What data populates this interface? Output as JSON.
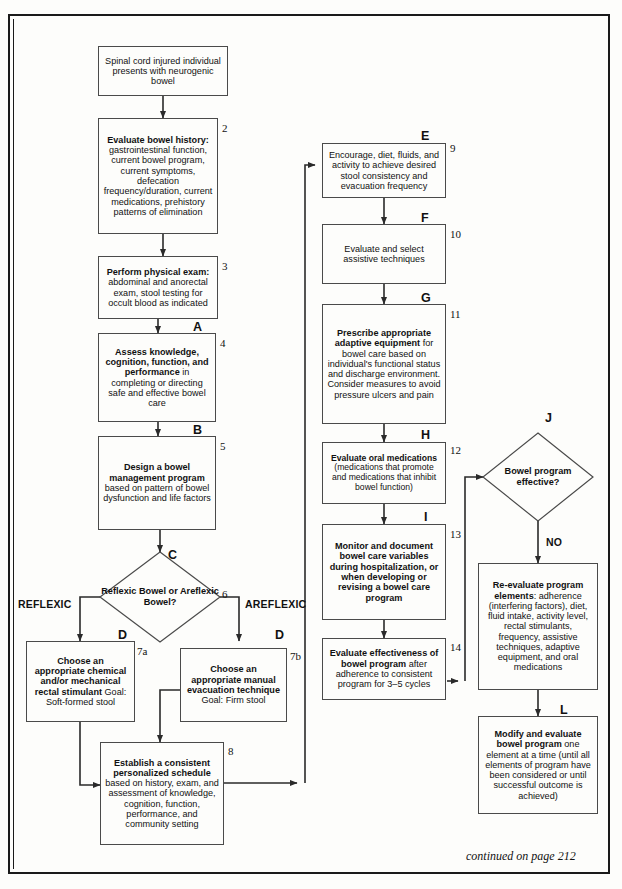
{
  "document": {
    "title": "Neurogenic Bowel Management Algorithm",
    "footer_note": "continued on page 212"
  },
  "branch_labels": {
    "left": "REFLEXIC",
    "right": "AREFLEXIC",
    "no": "NO"
  },
  "nodes": [
    {
      "id": "n1",
      "number": "",
      "letter": "",
      "shape": "box",
      "text_html": "Spinal cord injured individual presents with neurogenic bowel",
      "bold_prefix": ""
    },
    {
      "id": "n2",
      "number": "2",
      "letter": "",
      "shape": "box",
      "bold_prefix": "Evaluate bowel history:",
      "text_html": " gastrointestinal function, current bowel program, current symptoms, defecation frequency/duration, current medications, prehistory patterns of elimination"
    },
    {
      "id": "n3",
      "number": "3",
      "letter": "",
      "shape": "box",
      "bold_prefix": "Perform physical exam:",
      "text_html": " abdominal and anorectal exam, stool testing for occult blood as indicated"
    },
    {
      "id": "n4",
      "number": "4",
      "letter": "A",
      "shape": "box",
      "bold_prefix": "Assess knowledge, cognition, function, and performance",
      "text_html": " in completing or directing safe and effective bowel care"
    },
    {
      "id": "n5",
      "number": "5",
      "letter": "B",
      "shape": "box",
      "bold_prefix": "Design a bowel management program",
      "text_html": " based on pattern of bowel dysfunction and life factors"
    },
    {
      "id": "n6",
      "number": "6",
      "letter": "C",
      "shape": "diamond",
      "bold_prefix": "Reflexic Bowel or Areflexic Bowel?",
      "text_html": ""
    },
    {
      "id": "n7a",
      "number": "7a",
      "letter": "D",
      "shape": "box",
      "bold_prefix": "Choose an appropriate chemical and/or mechanical rectal stimulant",
      "text_html": " Goal: Soft-formed stool"
    },
    {
      "id": "n7b",
      "number": "7b",
      "letter": "D",
      "shape": "box",
      "bold_prefix": "Choose an appropriate manual evacuation technique",
      "text_html": " Goal: Firm stool"
    },
    {
      "id": "n8",
      "number": "8",
      "letter": "",
      "shape": "box",
      "bold_prefix": "Establish a consistent personalized schedule",
      "text_html": " based on history, exam, and assessment of knowledge, cognition, function, performance, and community setting"
    },
    {
      "id": "n9",
      "number": "9",
      "letter": "E",
      "shape": "box",
      "bold_prefix": "",
      "text_html": "Encourage, diet, fluids, and activity to achieve desired stool consistency and evacuation frequency"
    },
    {
      "id": "n10",
      "number": "10",
      "letter": "F",
      "shape": "box",
      "bold_prefix": "",
      "text_html": "Evaluate and select assistive techniques"
    },
    {
      "id": "n11",
      "number": "11",
      "letter": "G",
      "shape": "box",
      "bold_prefix": "Prescribe appropriate adaptive equipment",
      "text_html": " for bowel care based on individual's functional status and discharge environment. Consider measures to avoid pressure ulcers and pain"
    },
    {
      "id": "n12",
      "number": "12",
      "letter": "H",
      "shape": "box",
      "bold_prefix": "Evaluate oral medications",
      "text_html": " (medications that promote and medications that inhibit bowel function)"
    },
    {
      "id": "n13",
      "number": "13",
      "letter": "I",
      "shape": "box",
      "bold_prefix": "Monitor and document bowel care variables during hospitalization, or when developing or revising a bowel care program",
      "text_html": ""
    },
    {
      "id": "n14",
      "number": "14",
      "letter": "",
      "shape": "box",
      "bold_prefix": "Evaluate effectiveness of bowel program",
      "text_html": " after adherence to consistent program for 3–5 cycles"
    },
    {
      "id": "nJ",
      "number": "",
      "letter": "J",
      "shape": "diamond",
      "bold_prefix": "Bowel program effective?",
      "text_html": ""
    },
    {
      "id": "nK",
      "number": "",
      "letter": "",
      "shape": "box",
      "bold_prefix": "Re-evaluate program elements",
      "text_html": ": adherence (interfering factors), diet, fluid intake, activity level, rectal stimulants, frequency, assistive techniques, adaptive equipment, and oral medications"
    },
    {
      "id": "nL",
      "number": "",
      "letter": "L",
      "shape": "box",
      "bold_prefix": "Modify and evaluate bowel program",
      "text_html": " one element at a time (until all elements of program have been considered or until successful outcome is achieved)"
    }
  ],
  "colors": {
    "line": "#2a2a2a",
    "box_border": "#4a4a4a",
    "frame": "#1a1a1a",
    "text": "#111111",
    "background": "#fdfdfb"
  }
}
